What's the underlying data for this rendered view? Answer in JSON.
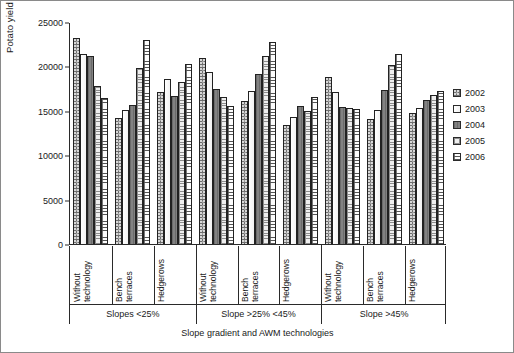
{
  "chart_data": {
    "type": "bar",
    "title": "",
    "xlabel": "Slope gradient and AWM technologies",
    "ylabel_text": "Potato yield (kg ha",
    "ylabel_sup": "-1",
    "ylabel_tail": ")",
    "ylabel_full": "Potato yield (kg ha-1)",
    "ylim": [
      0,
      25000
    ],
    "yticks": [
      0,
      5000,
      10000,
      15000,
      20000,
      25000
    ],
    "ytick_labels": [
      "0",
      "5000",
      "10000",
      "15000",
      "20000",
      "25000"
    ],
    "grid": false,
    "legend_position": "right",
    "legend_title": "",
    "series_names": [
      "2002",
      "2003",
      "2004",
      "2005",
      "2006"
    ],
    "series_colors": [
      "#6e6e6e",
      "#f7f7f7",
      "#767676",
      "#efefef",
      "#fdfdfd"
    ],
    "series_patterns": [
      "dotted-dark-gray",
      "solid-white",
      "solid-mid-gray",
      "light-crosshatch",
      "horizontal-line-grid"
    ],
    "group_axis_label": "Slope gradient",
    "groups": [
      {
        "label": "Slopes <25%",
        "categories": [
          {
            "label_line1": "Without",
            "label_line2": "technology",
            "label": "Without technology",
            "values": [
              23200,
              21400,
              21200,
              17800,
              16400
            ]
          },
          {
            "label_line1": "Bench",
            "label_line2": "terraces",
            "label": "Bench terraces",
            "values": [
              14200,
              15100,
              15600,
              19800,
              23000
            ]
          },
          {
            "label_line1": "Hedgerows",
            "label_line2": "",
            "label": "Hedgerows",
            "values": [
              17100,
              18600,
              16700,
              18300,
              20300
            ]
          }
        ]
      },
      {
        "label": "Slope >25% <45%",
        "categories": [
          {
            "label_line1": "Without",
            "label_line2": "technology",
            "label": "Without technology",
            "values": [
              21000,
              19400,
              17500,
              16600,
              15500
            ]
          },
          {
            "label_line1": "Bench",
            "label_line2": "terraces",
            "label": "Bench terraces",
            "values": [
              16100,
              17200,
              19100,
              21200,
              22800
            ]
          },
          {
            "label_line1": "Hedgerows",
            "label_line2": "",
            "label": "Hedgerows",
            "values": [
              13400,
              14300,
              15500,
              15000,
              16500
            ]
          }
        ]
      },
      {
        "label": "Slope >45%",
        "categories": [
          {
            "label_line1": "Without",
            "label_line2": "technology",
            "label": "Without technology",
            "values": [
              18800,
              17100,
              15400,
              15300,
              15200
            ]
          },
          {
            "label_line1": "Bench",
            "label_line2": "terraces",
            "label": "Bench terraces",
            "values": [
              14100,
              15100,
              17300,
              20200,
              21400
            ]
          },
          {
            "label_line1": "Hedgerows",
            "label_line2": "",
            "label": "Hedgerows",
            "values": [
              14800,
              15300,
              16200,
              16800,
              17200
            ]
          }
        ]
      }
    ]
  }
}
